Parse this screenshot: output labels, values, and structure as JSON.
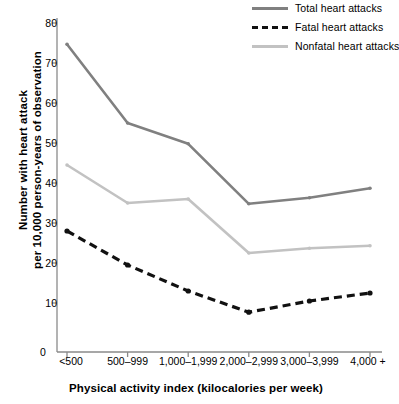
{
  "chart_data": {
    "type": "line",
    "title": "",
    "xlabel": "Physical activity index (kilocalories per week)",
    "ylabel_line1": "Number with heart attack",
    "ylabel_line2": "per 10,000 person-years of observation",
    "categories": [
      "<500",
      "500–999",
      "1,000–1,999",
      "2,000–2,999",
      "3,000–3,999",
      "4,000 +"
    ],
    "ylim": [
      0,
      80
    ],
    "yticks": [
      80,
      70,
      60,
      50,
      40,
      30,
      20,
      10
    ],
    "ytick_labels": [
      "80",
      "70",
      "60",
      "50",
      "40",
      "30",
      "20",
      "10"
    ],
    "origin_label": "0",
    "grid": false,
    "legend_position": "top-right",
    "series": [
      {
        "name": "Total heart attacks",
        "color": "#808080",
        "style": "solid",
        "values": [
          74.7,
          55.0,
          49.8,
          34.8,
          36.3,
          38.7
        ]
      },
      {
        "name": "Fatal heart attacks",
        "color": "#111111",
        "style": "dashed",
        "values": [
          28.0,
          19.5,
          13.0,
          7.7,
          10.5,
          12.5
        ]
      },
      {
        "name": "Nonfatal heart attacks",
        "color": "#c2c2c2",
        "style": "solid",
        "values": [
          44.5,
          35.0,
          36.0,
          22.5,
          23.7,
          24.3
        ]
      }
    ]
  },
  "axis_color": "#8a8a8a"
}
